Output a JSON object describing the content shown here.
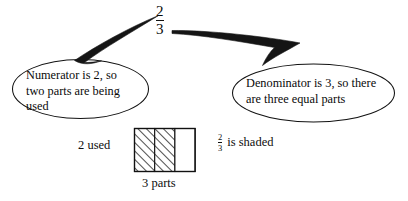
{
  "diagram": {
    "fraction": {
      "numerator": "2",
      "denominator": "3"
    },
    "callouts": [
      {
        "id": "numerator-callout",
        "text": "Numerator is 2, so\ntwo parts are being\nused",
        "points_to": "numerator"
      },
      {
        "id": "denominator-callout",
        "text": "Denominator is 3, so there\nare three equal parts",
        "points_to": "denominator"
      }
    ],
    "bar_model": {
      "used_label": "2 used",
      "parts_label": "3 parts",
      "total_parts": 3,
      "shaded_parts": 2,
      "shaded_caption": "is shaded",
      "shaded_fraction": {
        "numerator": "2",
        "denominator": "3"
      }
    },
    "colors": {
      "ink": "#111111",
      "paper": "#ffffff",
      "hatch": "#1a1a1a"
    }
  }
}
